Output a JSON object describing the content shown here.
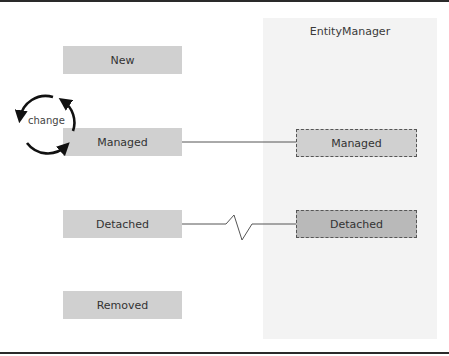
{
  "diagram": {
    "panel": {
      "title": "EntityManager"
    },
    "states": [
      {
        "id": "new",
        "label": "New"
      },
      {
        "id": "managed",
        "label": "Managed"
      },
      {
        "id": "detached",
        "label": "Detached"
      },
      {
        "id": "removed",
        "label": "Removed"
      }
    ],
    "entity_manager_states": [
      {
        "id": "managed",
        "label": "Managed"
      },
      {
        "id": "detached",
        "label": "Detached"
      }
    ],
    "cycle_label": "change",
    "connections": [
      {
        "from": "managed",
        "to": "em-managed",
        "style": "solid"
      },
      {
        "from": "detached",
        "to": "em-detached",
        "style": "broken"
      }
    ],
    "colors": {
      "state_fill": "#d0d0d0",
      "detached_em_fill": "#b9b9b9",
      "panel_fill": "#f3f3f3",
      "rule": "#2a2a2a"
    }
  }
}
